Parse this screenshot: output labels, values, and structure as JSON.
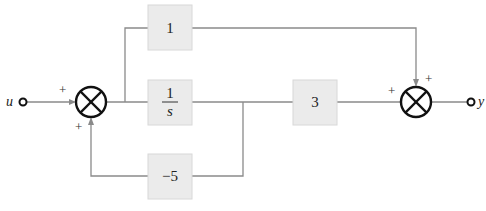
{
  "diagram": {
    "type": "block-diagram",
    "input": {
      "label": "u"
    },
    "output": {
      "label": "y"
    },
    "blocks": [
      {
        "id": "feedthrough",
        "text": "1"
      },
      {
        "id": "integrator",
        "numerator": "1",
        "denominator": "s"
      },
      {
        "id": "output-gain",
        "text": "3"
      },
      {
        "id": "feedback-gain",
        "text": "−5"
      }
    ],
    "summers": [
      {
        "id": "sum1",
        "signs": {
          "input": "+",
          "feedback": "+"
        }
      },
      {
        "id": "sum2",
        "signs": {
          "left": "+",
          "top": "+"
        }
      }
    ],
    "connections": [
      "u -> sum1 (+)",
      "sum1 -> feedthrough",
      "sum1 -> integrator",
      "integrator -> output-gain",
      "integrator -> feedback-gain",
      "feedback-gain -> sum1 (+)",
      "output-gain -> sum2 (+)",
      "feedthrough -> sum2 (+)",
      "sum2 -> y"
    ]
  }
}
